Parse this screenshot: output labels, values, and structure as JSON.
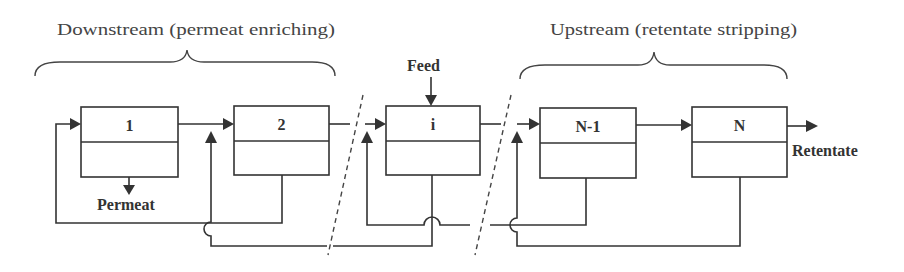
{
  "diagram": {
    "sections": {
      "downstream": {
        "label": "Downstream (permeat enriching)"
      },
      "upstream": {
        "label": "Upstream (retentate stripping)"
      }
    },
    "stages": [
      {
        "id": "stage-1",
        "label": "1"
      },
      {
        "id": "stage-2",
        "label": "2"
      },
      {
        "id": "stage-i",
        "label": "i"
      },
      {
        "id": "stage-n-1",
        "label": "N-1"
      },
      {
        "id": "stage-n",
        "label": "N"
      }
    ],
    "streams": {
      "feed": "Feed",
      "permeat": "Permeat",
      "retentate": "Retentate"
    },
    "colors": {
      "line": "#333333",
      "text": "#444444",
      "background": "#ffffff"
    }
  }
}
